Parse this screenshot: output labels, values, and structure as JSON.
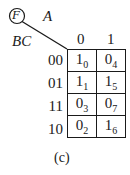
{
  "diagram": {
    "function_label": "F",
    "col_var": "A",
    "row_var": "BC",
    "col_headers": [
      "0",
      "1"
    ],
    "rows": [
      {
        "label": "00",
        "cells": [
          {
            "value": "1",
            "index": "0"
          },
          {
            "value": "0",
            "index": "4"
          }
        ]
      },
      {
        "label": "01",
        "cells": [
          {
            "value": "1",
            "index": "1"
          },
          {
            "value": "1",
            "index": "5"
          }
        ]
      },
      {
        "label": "11",
        "cells": [
          {
            "value": "0",
            "index": "3"
          },
          {
            "value": "0",
            "index": "7"
          }
        ]
      },
      {
        "label": "10",
        "cells": [
          {
            "value": "0",
            "index": "2"
          },
          {
            "value": "1",
            "index": "6"
          }
        ]
      }
    ],
    "caption": "(c)"
  }
}
